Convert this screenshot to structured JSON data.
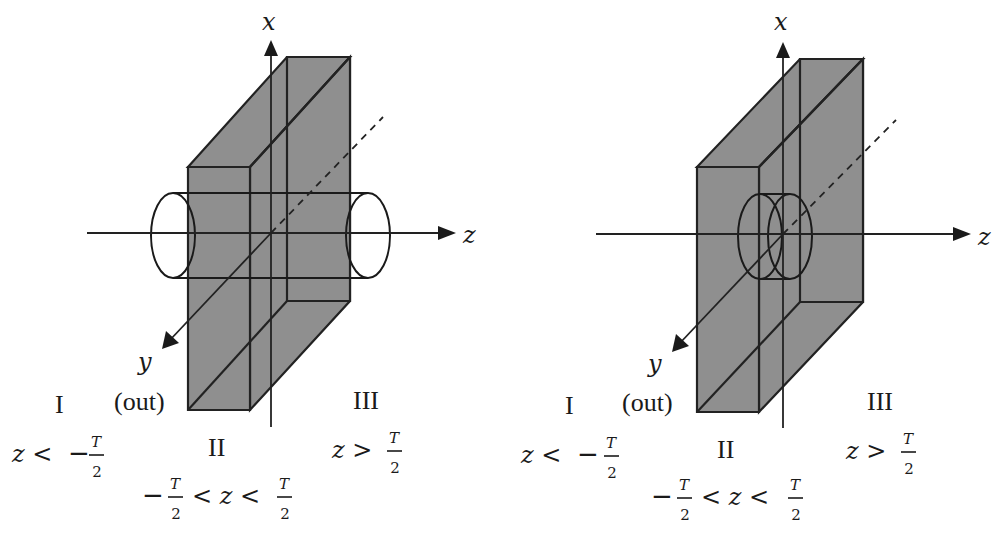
{
  "figure": {
    "colors": {
      "slab_fill": "#8f8f8f",
      "line": "#222222",
      "background": "#ffffff"
    },
    "panels": [
      {
        "id": "left",
        "axis_labels": {
          "x": "x",
          "z": "z",
          "y": "y",
          "y_note": "(out)"
        },
        "regions": [
          {
            "name": "I",
            "condition_lhs": "z <",
            "condition_sign": "−",
            "condition_num": "T",
            "condition_den": "2"
          },
          {
            "name": "II",
            "condition_left_sign": "−",
            "condition_num": "T",
            "condition_den": "2",
            "condition_mid": "< z <"
          },
          {
            "name": "III",
            "condition_lhs": "z >",
            "condition_num": "T",
            "condition_den": "2"
          }
        ]
      },
      {
        "id": "right",
        "axis_labels": {
          "x": "x",
          "z": "z",
          "y": "y",
          "y_note": "(out)"
        },
        "regions": [
          {
            "name": "I",
            "condition_lhs": "z <",
            "condition_sign": "−",
            "condition_num": "T",
            "condition_den": "2"
          },
          {
            "name": "II",
            "condition_left_sign": "−",
            "condition_num": "T",
            "condition_den": "2",
            "condition_mid": "< z <"
          },
          {
            "name": "III",
            "condition_lhs": "z >",
            "condition_num": "T",
            "condition_den": "2"
          }
        ]
      }
    ]
  }
}
